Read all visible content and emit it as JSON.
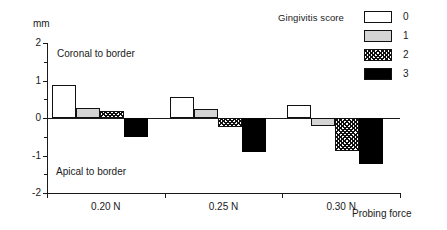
{
  "legend": {
    "title": "Gingivitis score",
    "entries": [
      {
        "label": "0",
        "swatch": "white"
      },
      {
        "label": "1",
        "swatch": "light-gray"
      },
      {
        "label": "2",
        "swatch": "hatched"
      },
      {
        "label": "3",
        "swatch": "black"
      }
    ]
  },
  "annotations": {
    "top": "Coronal to border",
    "bottom": "Apical to border"
  },
  "axes": {
    "y_unit": "mm",
    "y_ticks": [
      "2",
      "1",
      "0",
      "-1",
      "-2"
    ],
    "x_title": "Probing force"
  },
  "chart_data": {
    "type": "bar",
    "title": "",
    "xlabel": "Probing force",
    "ylabel": "mm",
    "ylim": [
      -2,
      2
    ],
    "yticks": [
      2,
      1,
      0,
      -1,
      -2
    ],
    "yminor_step": 0.5,
    "grid": false,
    "legend_title": "Gingivitis score",
    "legend_position": "top-right",
    "categories": [
      "0.20 N",
      "0.25 N",
      "0.30 N"
    ],
    "series": [
      {
        "name": "0",
        "fill": "white",
        "values": [
          0.88,
          0.55,
          0.35
        ]
      },
      {
        "name": "1",
        "fill": "light-gray",
        "values": [
          0.28,
          0.24,
          -0.2
        ]
      },
      {
        "name": "2",
        "fill": "hatched",
        "values": [
          0.2,
          -0.25,
          -0.88
        ]
      },
      {
        "name": "3",
        "fill": "black",
        "values": [
          -0.5,
          -0.9,
          -1.22
        ]
      }
    ],
    "annotations": [
      "Coronal to border",
      "Apical to border"
    ],
    "colors": {
      "score_0": "#ffffff",
      "score_1": "#d4d4d4",
      "score_2": "#ffffff",
      "score_3": "#000000",
      "axis": "#1a1a1a"
    }
  }
}
